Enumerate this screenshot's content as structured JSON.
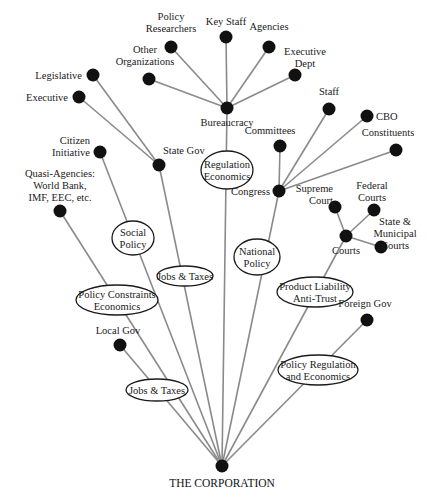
{
  "diagram": {
    "root": {
      "id": "corp",
      "label": "THE CORPORATION",
      "x": 222,
      "y": 466
    },
    "hubs": [
      {
        "id": "bureaucracy",
        "label": "Bureaucracy",
        "x": 227,
        "y": 108
      },
      {
        "id": "stategov",
        "label": "State Gov",
        "x": 159,
        "y": 165
      },
      {
        "id": "congress",
        "label": "Congress",
        "x": 279,
        "y": 191
      },
      {
        "id": "courts",
        "label": "Courts",
        "x": 346,
        "y": 236
      }
    ],
    "leaves": [
      {
        "id": "policyres",
        "label": [
          "Policy",
          "Researchers"
        ],
        "x": 171,
        "y": 47,
        "parent": "bureaucracy"
      },
      {
        "id": "keystaff",
        "label": [
          "Key Staff"
        ],
        "x": 226,
        "y": 37,
        "parent": "bureaucracy"
      },
      {
        "id": "agencies",
        "label": [
          "Agencies"
        ],
        "x": 269,
        "y": 47,
        "parent": "bureaucracy"
      },
      {
        "id": "otherorg",
        "label": [
          "Other",
          "Organizations"
        ],
        "x": 149,
        "y": 79,
        "parent": "bureaucracy"
      },
      {
        "id": "execdept",
        "label": [
          "Executive",
          "Dept"
        ],
        "x": 295,
        "y": 75,
        "parent": "bureaucracy"
      },
      {
        "id": "legislative",
        "label": [
          "Legislative"
        ],
        "x": 93,
        "y": 75,
        "parent": "stategov"
      },
      {
        "id": "executive",
        "label": [
          "Executive"
        ],
        "x": 79,
        "y": 97,
        "parent": "stategov"
      },
      {
        "id": "staff",
        "label": [
          "Staff"
        ],
        "x": 329,
        "y": 109,
        "parent": "congress"
      },
      {
        "id": "cbo",
        "label": [
          "CBO"
        ],
        "x": 367,
        "y": 116,
        "parent": "congress"
      },
      {
        "id": "constituents",
        "label": [
          "Constituents"
        ],
        "x": 396,
        "y": 150,
        "parent": "congress"
      },
      {
        "id": "committees",
        "label": [
          "Committees"
        ],
        "x": 280,
        "y": 146,
        "parent": "congress"
      },
      {
        "id": "supreme",
        "label": [
          "Supreme",
          "Court"
        ],
        "x": 335,
        "y": 207,
        "parent": "courts"
      },
      {
        "id": "federal",
        "label": [
          "Federal",
          "Courts"
        ],
        "x": 374,
        "y": 210,
        "parent": "courts"
      },
      {
        "id": "statemun",
        "label": [
          "State &",
          "Municipal",
          "Courts"
        ],
        "x": 381,
        "y": 247,
        "parent": "courts"
      },
      {
        "id": "citizen",
        "label": [
          "Citizen",
          "Initiative"
        ],
        "x": 100,
        "y": 152,
        "parent": "corp"
      },
      {
        "id": "quasi",
        "label": [
          "Quasi-Agencies:",
          "World Bank,",
          "IMF, EEC, etc."
        ],
        "x": 60,
        "y": 211,
        "parent": "corp"
      },
      {
        "id": "foreigngov",
        "label": [
          "Foreign Gov"
        ],
        "x": 367,
        "y": 320,
        "parent": "corp"
      },
      {
        "id": "localgov",
        "label": [
          "Local Gov"
        ],
        "x": 120,
        "y": 345,
        "parent": "corp"
      }
    ],
    "edge_labels": [
      {
        "id": "regecon",
        "lines": [
          "Regulation",
          "Economics"
        ],
        "x": 227,
        "y": 170,
        "rx": 26,
        "ry": 19
      },
      {
        "id": "socpol",
        "lines": [
          "Social",
          "Policy"
        ],
        "x": 133,
        "y": 238,
        "rx": 21,
        "ry": 17
      },
      {
        "id": "jobs1",
        "lines": [
          "Jobs & Taxes"
        ],
        "x": 185,
        "y": 276,
        "rx": 28,
        "ry": 10
      },
      {
        "id": "natpol",
        "lines": [
          "National",
          "Policy"
        ],
        "x": 257,
        "y": 257,
        "rx": 23,
        "ry": 18
      },
      {
        "id": "polcon",
        "lines": [
          "Policy Constraints",
          "Economics"
        ],
        "x": 117,
        "y": 300,
        "rx": 41,
        "ry": 15
      },
      {
        "id": "prodliab",
        "lines": [
          "Product Liability",
          "Anti-Trust"
        ],
        "x": 315,
        "y": 292,
        "rx": 38,
        "ry": 15
      },
      {
        "id": "jobs2",
        "lines": [
          "Jobs & Taxes"
        ],
        "x": 157,
        "y": 390,
        "rx": 31,
        "ry": 11
      },
      {
        "id": "polreg",
        "lines": [
          "Policy Regulation",
          "and Economics"
        ],
        "x": 318,
        "y": 370,
        "rx": 40,
        "ry": 15
      }
    ],
    "footer_fragment": "a a a"
  }
}
